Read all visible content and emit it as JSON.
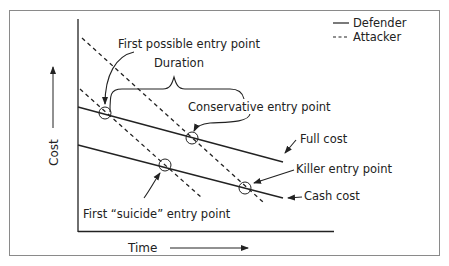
{
  "diagram": {
    "legend": {
      "defender_label": "Defender",
      "attacker_label": "Attacker"
    },
    "axes": {
      "y_label": "Cost",
      "x_label": "Time"
    },
    "lines": {
      "full_cost_label": "Full cost",
      "cash_cost_label": "Cash cost"
    },
    "annotations": {
      "first_possible_entry": "First possible entry point",
      "duration": "Duration",
      "conservative_entry": "Conservative entry point",
      "killer_entry": "Killer entry point",
      "first_suicide_entry": "First “suicide” entry point"
    },
    "colors": {
      "ink": "#222222",
      "frame": "#8a8a8a",
      "background": "#ffffff"
    }
  }
}
